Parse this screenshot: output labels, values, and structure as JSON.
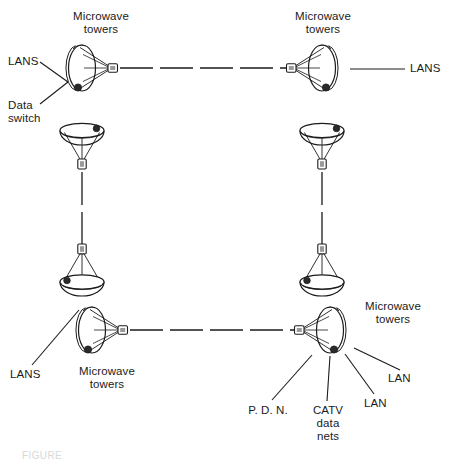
{
  "diagram": {
    "stroke_color": "#1b1b1b",
    "fill_color": "#ffffff",
    "background": "#ffffff"
  },
  "labels": {
    "top_left_tower": "Microwave\ntowers",
    "top_left_lans": "LANS",
    "top_left_data_switch": "Data\nswitch",
    "top_right_tower": "Microwave\ntowers",
    "top_right_lans": "LANS",
    "bottom_left_lans": "LANS",
    "bottom_left_tower": "Microwave\ntowers",
    "bottom_right_tower": "Microwave\ntowers",
    "bottom_right_pdn": "P. D. N.",
    "bottom_right_catv": "CATV\ndata\nnets",
    "bottom_right_lan_1": "LAN",
    "bottom_right_lan_2": "LAN"
  },
  "nodes": [
    {
      "id": "horn-top-left",
      "kind": "horn-antenna",
      "facing": "right",
      "x": 82,
      "y": 68
    },
    {
      "id": "dish-top-left",
      "kind": "dish-up",
      "facing": "up",
      "x": 82,
      "y": 134
    },
    {
      "id": "horn-top-right",
      "kind": "horn-antenna",
      "facing": "left",
      "x": 322,
      "y": 68
    },
    {
      "id": "dish-top-right",
      "kind": "dish-up",
      "facing": "up",
      "x": 322,
      "y": 134
    },
    {
      "id": "dish-bottom-left",
      "kind": "dish-down",
      "facing": "down",
      "x": 82,
      "y": 279
    },
    {
      "id": "horn-bottom-left",
      "kind": "horn-antenna",
      "facing": "right",
      "x": 92,
      "y": 330
    },
    {
      "id": "dish-bottom-right",
      "kind": "dish-down",
      "facing": "down",
      "x": 322,
      "y": 279
    },
    {
      "id": "horn-bottom-right",
      "kind": "horn-antenna",
      "facing": "left",
      "x": 330,
      "y": 330
    }
  ],
  "links": [
    {
      "id": "link-top",
      "style": "dashed",
      "from": "horn-top-left",
      "to": "horn-top-right"
    },
    {
      "id": "link-left",
      "style": "dashed",
      "from": "dish-top-left",
      "to": "dish-bottom-left"
    },
    {
      "id": "link-right",
      "style": "dashed",
      "from": "dish-top-right",
      "to": "dish-bottom-right"
    },
    {
      "id": "link-bottom",
      "style": "dashed",
      "from": "horn-bottom-left",
      "to": "horn-bottom-right"
    }
  ],
  "leaders": [
    {
      "id": "leader-top-left-lans",
      "style": "solid"
    },
    {
      "id": "leader-top-left-switch",
      "style": "solid"
    },
    {
      "id": "leader-top-right-lans",
      "style": "solid"
    },
    {
      "id": "leader-bottom-left-lans",
      "style": "solid"
    },
    {
      "id": "leader-pdn",
      "style": "solid"
    },
    {
      "id": "leader-catv",
      "style": "solid"
    },
    {
      "id": "leader-lan-lower",
      "style": "solid"
    },
    {
      "id": "leader-lan-upper",
      "style": "solid"
    }
  ],
  "caption": {
    "text": "FIGURE"
  }
}
